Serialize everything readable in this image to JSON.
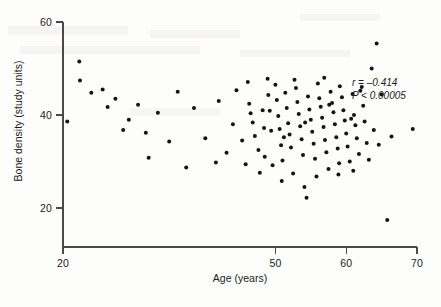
{
  "chart_data": {
    "type": "scatter",
    "title": "",
    "xlabel": "Age (years)",
    "ylabel": "Bone density (study units)",
    "xlim": [
      20,
      70
    ],
    "ylim": [
      14,
      62
    ],
    "xticks": [
      20,
      50,
      60,
      70
    ],
    "yticks": [
      20,
      40,
      60
    ],
    "grid": false,
    "legend": null,
    "annotations": {
      "r_label": "r",
      "r_relation": " = ",
      "r_value": "–0.414",
      "p_label": "P",
      "p_relation": " < ",
      "p_value": "0.00005",
      "r_text": "r = –0.414",
      "p_text": "P < 0.00005"
    },
    "marker": {
      "shape": "circle",
      "color": "#141414",
      "radius": 2.0
    },
    "points": [
      [
        20.6,
        38.6
      ],
      [
        22.3,
        51.5
      ],
      [
        22.4,
        47.4
      ],
      [
        24.0,
        44.8
      ],
      [
        25.6,
        45.5
      ],
      [
        26.3,
        41.7
      ],
      [
        27.4,
        43.5
      ],
      [
        28.5,
        36.8
      ],
      [
        30.6,
        42.2
      ],
      [
        31.7,
        36.2
      ],
      [
        32.1,
        30.8
      ],
      [
        35.0,
        34.3
      ],
      [
        37.4,
        28.7
      ],
      [
        40.1,
        35.0
      ],
      [
        41.6,
        29.8
      ],
      [
        43.1,
        31.9
      ],
      [
        44.5,
        45.3
      ],
      [
        46.1,
        47.1
      ],
      [
        46.3,
        42.4
      ],
      [
        46.5,
        40.4
      ],
      [
        46.8,
        38.4
      ],
      [
        47.1,
        35.5
      ],
      [
        47.6,
        32.5
      ],
      [
        48.2,
        41.0
      ],
      [
        48.4,
        37.2
      ],
      [
        48.5,
        31.0
      ],
      [
        49.0,
        44.3
      ],
      [
        49.2,
        40.9
      ],
      [
        49.4,
        36.6
      ],
      [
        49.6,
        29.2
      ],
      [
        50.0,
        46.5
      ],
      [
        50.2,
        43.2
      ],
      [
        50.4,
        39.8
      ],
      [
        50.6,
        37.0
      ],
      [
        50.8,
        33.5
      ],
      [
        51.0,
        30.2
      ],
      [
        51.4,
        44.8
      ],
      [
        51.6,
        41.5
      ],
      [
        51.8,
        38.2
      ],
      [
        52.0,
        35.8
      ],
      [
        52.2,
        33.0
      ],
      [
        52.5,
        27.4
      ],
      [
        52.9,
        45.8
      ],
      [
        53.1,
        42.8
      ],
      [
        53.3,
        40.2
      ],
      [
        53.5,
        37.6
      ],
      [
        53.7,
        34.8
      ],
      [
        53.9,
        31.4
      ],
      [
        54.1,
        24.5
      ],
      [
        54.4,
        22.2
      ],
      [
        54.6,
        44.0
      ],
      [
        54.8,
        41.2
      ],
      [
        55.0,
        39.0
      ],
      [
        55.2,
        36.4
      ],
      [
        55.4,
        33.8
      ],
      [
        55.6,
        30.6
      ],
      [
        56.0,
        46.8
      ],
      [
        56.2,
        43.6
      ],
      [
        56.4,
        41.8
      ],
      [
        56.6,
        39.4
      ],
      [
        56.8,
        37.4
      ],
      [
        57.0,
        34.6
      ],
      [
        57.2,
        32.0
      ],
      [
        57.5,
        28.4
      ],
      [
        57.8,
        45.0
      ],
      [
        58.0,
        42.6
      ],
      [
        58.2,
        40.6
      ],
      [
        58.4,
        38.0
      ],
      [
        58.6,
        35.2
      ],
      [
        58.8,
        32.8
      ],
      [
        59.0,
        29.6
      ],
      [
        59.4,
        43.8
      ],
      [
        59.6,
        41.0
      ],
      [
        59.8,
        38.8
      ],
      [
        60.0,
        36.0
      ],
      [
        60.2,
        33.2
      ],
      [
        60.5,
        30.0
      ],
      [
        60.9,
        44.5
      ],
      [
        61.1,
        40.0
      ],
      [
        61.3,
        37.8
      ],
      [
        61.5,
        35.0
      ],
      [
        61.8,
        31.6
      ],
      [
        62.2,
        46.0
      ],
      [
        62.4,
        42.0
      ],
      [
        62.6,
        38.6
      ],
      [
        62.9,
        34.0
      ],
      [
        63.2,
        30.4
      ],
      [
        63.6,
        50.0
      ],
      [
        63.9,
        36.8
      ],
      [
        64.3,
        55.4
      ],
      [
        64.6,
        33.6
      ],
      [
        65.0,
        44.4
      ],
      [
        65.8,
        17.4
      ],
      [
        66.4,
        35.4
      ],
      [
        69.4,
        37.0
      ],
      [
        45.3,
        34.5
      ],
      [
        44.0,
        38.0
      ],
      [
        42.0,
        43.0
      ],
      [
        38.5,
        41.5
      ],
      [
        36.2,
        45.0
      ],
      [
        33.4,
        40.5
      ],
      [
        29.3,
        39.0
      ],
      [
        45.8,
        29.4
      ],
      [
        47.8,
        27.6
      ],
      [
        50.9,
        25.8
      ],
      [
        55.8,
        26.8
      ],
      [
        58.9,
        27.2
      ],
      [
        61.0,
        28.0
      ],
      [
        52.7,
        47.6
      ],
      [
        56.9,
        48.0
      ],
      [
        59.1,
        46.2
      ],
      [
        62.0,
        45.2
      ],
      [
        48.9,
        47.8
      ],
      [
        51.2,
        35.2
      ],
      [
        54.2,
        38.4
      ],
      [
        57.6,
        42.2
      ],
      [
        60.7,
        39.2
      ]
    ]
  }
}
